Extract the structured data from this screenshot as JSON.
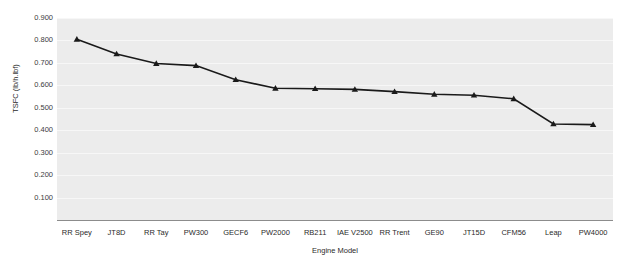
{
  "chart_data": {
    "type": "line",
    "title": "",
    "xlabel": "Engine Model",
    "ylabel": "TSFC (lb/h.lbf)",
    "categories": [
      "RR Spey",
      "JT8D",
      "RR Tay",
      "PW300",
      "GECF6",
      "PW2000",
      "RB211",
      "IAE V2500",
      "RR Trent",
      "GE90",
      "JT15D",
      "CFM56",
      "Leap",
      "PW4000"
    ],
    "values": [
      0.805,
      0.74,
      0.697,
      0.688,
      0.625,
      0.587,
      0.585,
      0.582,
      0.572,
      0.56,
      0.556,
      0.54,
      0.428,
      0.425
    ],
    "ylim": [
      0.0,
      0.9
    ],
    "ytick_labels": [
      "0.900",
      "0.800",
      "0.700",
      "0.600",
      "0.500",
      "0.400",
      "0.300",
      "0.200",
      "0.100"
    ],
    "ytick_values": [
      0.9,
      0.8,
      0.7,
      0.6,
      0.5,
      0.4,
      0.3,
      0.2,
      0.1
    ],
    "grid": true,
    "legend": "none",
    "series_color": "#1a1a1a",
    "marker": "triangle",
    "plot_background": "#ececec"
  }
}
